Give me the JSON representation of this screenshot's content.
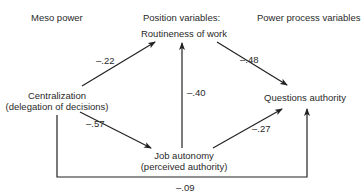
{
  "headers": {
    "left": "Meso power",
    "middle": "Position variables:",
    "right": "Power process variables"
  },
  "nodes": {
    "routineness": {
      "label": "Routineness of work"
    },
    "centralization": {
      "label": "Centralization",
      "sublabel": "(delegation of decisions)"
    },
    "questions_authority": {
      "label": "Questions authority"
    },
    "job_autonomy": {
      "label": "Job autonomy",
      "sublabel": "(perceived authority)"
    }
  },
  "edges": [
    {
      "from": "centralization",
      "to": "routineness",
      "coefficient": "–.22"
    },
    {
      "from": "routineness",
      "to": "questions_authority",
      "coefficient": "–.48"
    },
    {
      "from": "job_autonomy",
      "to": "routineness",
      "coefficient": "–.40"
    },
    {
      "from": "centralization",
      "to": "job_autonomy",
      "coefficient": "–.57"
    },
    {
      "from": "job_autonomy",
      "to": "questions_authority",
      "coefficient": "–.27"
    },
    {
      "from": "centralization",
      "to": "questions_authority",
      "coefficient": "–.09"
    }
  ],
  "colors": {
    "line": "#222222",
    "text": "#2a2a2a",
    "background": "#ffffff"
  }
}
